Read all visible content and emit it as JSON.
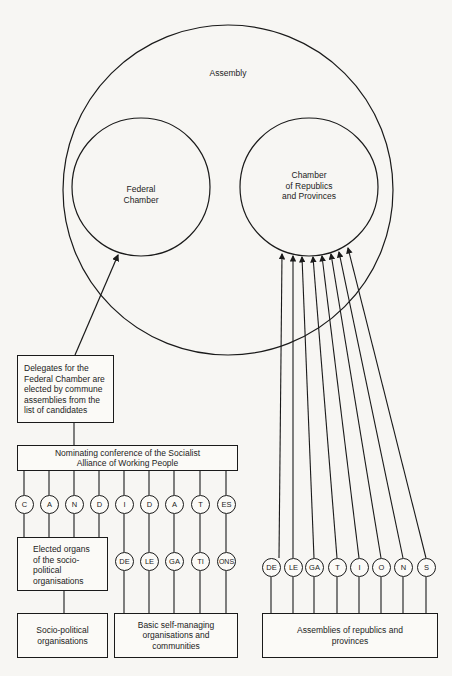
{
  "assembly": {
    "title": "Assembly",
    "federal_chamber": "Federal\nChamber",
    "chamber_republics": "Chamber\nof Republics\nand Provinces"
  },
  "boxes": {
    "delegates": "Delegates for the Federal Chamber are elected by commune assemblies from the list of candidates",
    "nominating": "Nominating conference of the Socialist Alliance of Working People",
    "elected_organs": "Elected organs of the socio-political organisations",
    "socio_political": "Socio-political organisations",
    "basic_self_managing": "Basic self-managing organisations and communities",
    "assemblies_republics": "Assemblies of republics and provinces"
  },
  "candidates_nodes": [
    "C",
    "A",
    "N",
    "D",
    "I",
    "D",
    "A",
    "T",
    "ES"
  ],
  "delegations_left_nodes": [
    "DE",
    "LE",
    "GA",
    "TI",
    "ONS"
  ],
  "delegations_right_nodes": [
    "DE",
    "LE",
    "GA",
    "T",
    "I",
    "O",
    "N",
    "S"
  ],
  "colors": {
    "line": "#1a1a1a",
    "paper": "#f7f6f3"
  }
}
